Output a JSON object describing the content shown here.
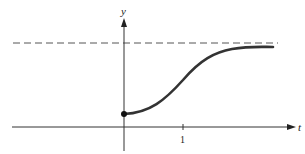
{
  "diagram": {
    "type": "function-graph",
    "axes": {
      "x_label": "t",
      "y_label": "y",
      "x_tick_labels": [
        "1"
      ]
    },
    "asymptote": {
      "style": "dashed",
      "orientation": "horizontal"
    },
    "curve": {
      "shape": "sigmoid",
      "start_point": "filled-dot on y-axis"
    },
    "colors": {
      "axis": "#333333",
      "curve": "#333333",
      "asymptote": "#555555"
    }
  }
}
